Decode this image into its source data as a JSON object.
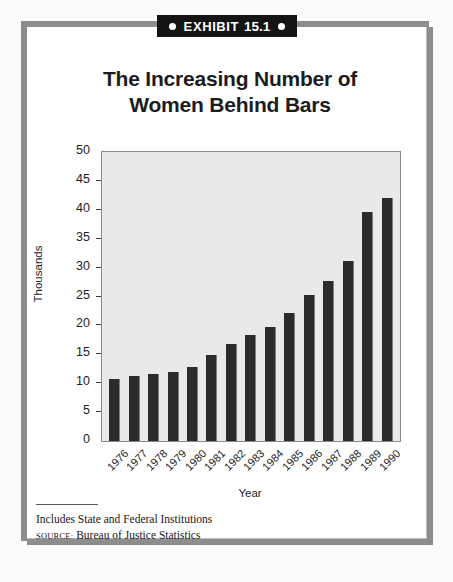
{
  "exhibit": {
    "label": "EXHIBIT",
    "number": "15.1",
    "left_dot": "bullet-dot",
    "right_dot": "bullet-dot"
  },
  "chart_data": {
    "type": "bar",
    "title": "The Increasing Number of Women Behind Bars",
    "title_line1": "The Increasing Number of",
    "title_line2": "Women Behind Bars",
    "xlabel": "Year",
    "ylabel": "Thousands",
    "categories": [
      "1976",
      "1977",
      "1978",
      "1979",
      "1980",
      "1981",
      "1982",
      "1983",
      "1984",
      "1985",
      "1986",
      "1987",
      "1988",
      "1989",
      "1990"
    ],
    "values": [
      10.8,
      11.2,
      11.6,
      11.9,
      12.8,
      14.8,
      16.8,
      18.4,
      19.7,
      22.2,
      25.2,
      27.7,
      31.1,
      39.7,
      42.0
    ],
    "ylim": [
      0,
      50
    ],
    "yticks": [
      0,
      5,
      10,
      15,
      20,
      25,
      30,
      35,
      40,
      45,
      50
    ],
    "ytick_labels": [
      "0",
      "5",
      "10",
      "15",
      "20",
      "25",
      "30",
      "35",
      "40",
      "45",
      "50"
    ],
    "grid": false,
    "legend": null,
    "bar_color": "#2b2b2b",
    "plot_bg": "#e9e9e7"
  },
  "footnotes": {
    "note": "Includes State and Federal Institutions",
    "source_prefix": "Source:",
    "source_text": "Bureau of Justice Statistics"
  }
}
